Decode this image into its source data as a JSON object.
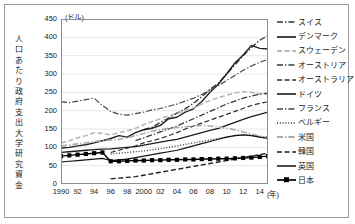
{
  "chart_data": {
    "type": "line",
    "title": "",
    "unit_label": "(ドル)",
    "ylabel": "人口あたり政府支出大学研究資金",
    "xlabel": "(年)",
    "ylim": [
      0,
      450
    ],
    "yticks": [
      0,
      50,
      100,
      150,
      200,
      250,
      300,
      350,
      400,
      450
    ],
    "grid": "horizontal",
    "legend_position": "right",
    "xlim": [
      1990,
      2015
    ],
    "x": [
      1990,
      1991,
      1992,
      1993,
      1994,
      1995,
      1996,
      1997,
      1998,
      1999,
      2000,
      2001,
      2002,
      2003,
      2004,
      2005,
      2006,
      2007,
      2008,
      2009,
      2010,
      2011,
      2012,
      2013,
      2014,
      2015
    ],
    "xtick_labels": [
      "1990",
      "92",
      "94",
      "96",
      "98",
      "2000",
      "02",
      "04",
      "06",
      "08",
      "10",
      "12",
      "14"
    ],
    "xtick_values": [
      1990,
      1992,
      1994,
      1996,
      1998,
      2000,
      2002,
      2004,
      2006,
      2008,
      2010,
      2012,
      2014
    ],
    "series": [
      {
        "name": "スイス",
        "style": "dash-dot",
        "color": "#333333",
        "width": 1.4,
        "values": [
          null,
          null,
          null,
          null,
          null,
          null,
          null,
          null,
          null,
          null,
          148,
          155,
          168,
          180,
          193,
          205,
          220,
          238,
          258,
          275,
          300,
          325,
          350,
          372,
          392,
          405
        ]
      },
      {
        "name": "デンマーク",
        "style": "solid",
        "color": "#222222",
        "width": 1.4,
        "values": [
          98,
          100,
          104,
          107,
          112,
          118,
          124,
          132,
          128,
          140,
          148,
          152,
          160,
          178,
          182,
          196,
          205,
          225,
          250,
          272,
          300,
          330,
          352,
          378,
          370,
          368
        ]
      },
      {
        "name": "スウェーデン",
        "style": "dash",
        "color": "#b8b8b8",
        "width": 1.6,
        "values": [
          112,
          118,
          126,
          132,
          140,
          138,
          134,
          140,
          145,
          152,
          162,
          170,
          178,
          186,
          192,
          200,
          208,
          218,
          228,
          235,
          242,
          248,
          252,
          250,
          246,
          244
        ]
      },
      {
        "name": "オーストリア",
        "style": "dash-dot",
        "color": "#3a3a3a",
        "width": 1.3,
        "values": [
          null,
          null,
          null,
          null,
          null,
          null,
          null,
          null,
          null,
          118,
          126,
          134,
          142,
          150,
          158,
          168,
          178,
          188,
          198,
          208,
          218,
          226,
          234,
          240,
          245,
          248
        ]
      },
      {
        "name": "オーストラリア",
        "style": "dash",
        "color": "#2e2e2e",
        "width": 1.2,
        "values": [
          null,
          null,
          null,
          null,
          null,
          null,
          86,
          92,
          98,
          104,
          112,
          118,
          124,
          132,
          140,
          150,
          158,
          166,
          174,
          182,
          190,
          198,
          206,
          214,
          220,
          224
        ]
      },
      {
        "name": "ドイツ",
        "style": "solid",
        "color": "#1c1c1c",
        "width": 1.3,
        "values": [
          86,
          88,
          90,
          92,
          94,
          95,
          96,
          98,
          100,
          102,
          106,
          110,
          114,
          118,
          122,
          128,
          134,
          140,
          146,
          152,
          160,
          168,
          176,
          184,
          190,
          196
        ]
      },
      {
        "name": "フランス",
        "style": "dash-dot",
        "color": "#444444",
        "width": 1.2,
        "values": [
          224,
          222,
          226,
          230,
          234,
          214,
          198,
          190,
          188,
          192,
          196,
          202,
          206,
          212,
          218,
          226,
          234,
          244,
          256,
          268,
          282,
          296,
          310,
          322,
          332,
          340
        ]
      },
      {
        "name": "ベルギー",
        "style": "dotted",
        "color": "#2a2a2a",
        "width": 1.3,
        "values": [
          null,
          null,
          null,
          null,
          null,
          null,
          82,
          84,
          86,
          88,
          90,
          93,
          96,
          100,
          104,
          108,
          112,
          116,
          120,
          124,
          128,
          132,
          134,
          133,
          130,
          128
        ]
      },
      {
        "name": "米国",
        "style": "dash-dot",
        "color": "#aaaaaa",
        "width": 1.6,
        "values": [
          104,
          106,
          110,
          112,
          116,
          118,
          120,
          122,
          126,
          132,
          138,
          144,
          148,
          152,
          154,
          156,
          158,
          160,
          158,
          156,
          152,
          148,
          142,
          136,
          130,
          126
        ]
      },
      {
        "name": "韓国",
        "style": "dash",
        "color": "#1e1e1e",
        "width": 1.4,
        "values": [
          null,
          null,
          null,
          null,
          null,
          null,
          14,
          16,
          18,
          20,
          24,
          28,
          32,
          36,
          40,
          44,
          48,
          52,
          56,
          60,
          64,
          68,
          72,
          76,
          80,
          84
        ]
      },
      {
        "name": "英国",
        "style": "solid",
        "color": "#111111",
        "width": 1.2,
        "values": [
          60,
          62,
          64,
          66,
          68,
          70,
          64,
          66,
          68,
          72,
          76,
          80,
          84,
          88,
          92,
          98,
          104,
          110,
          116,
          122,
          128,
          132,
          134,
          132,
          128,
          124
        ]
      },
      {
        "name": "日本",
        "style": "solid-square",
        "color": "#000000",
        "width": 1.4,
        "values": [
          76,
          78,
          80,
          82,
          84,
          86,
          62,
          62,
          63,
          64,
          64,
          65,
          65,
          66,
          66,
          67,
          67,
          68,
          68,
          69,
          69,
          70,
          71,
          72,
          74,
          76
        ]
      }
    ]
  }
}
